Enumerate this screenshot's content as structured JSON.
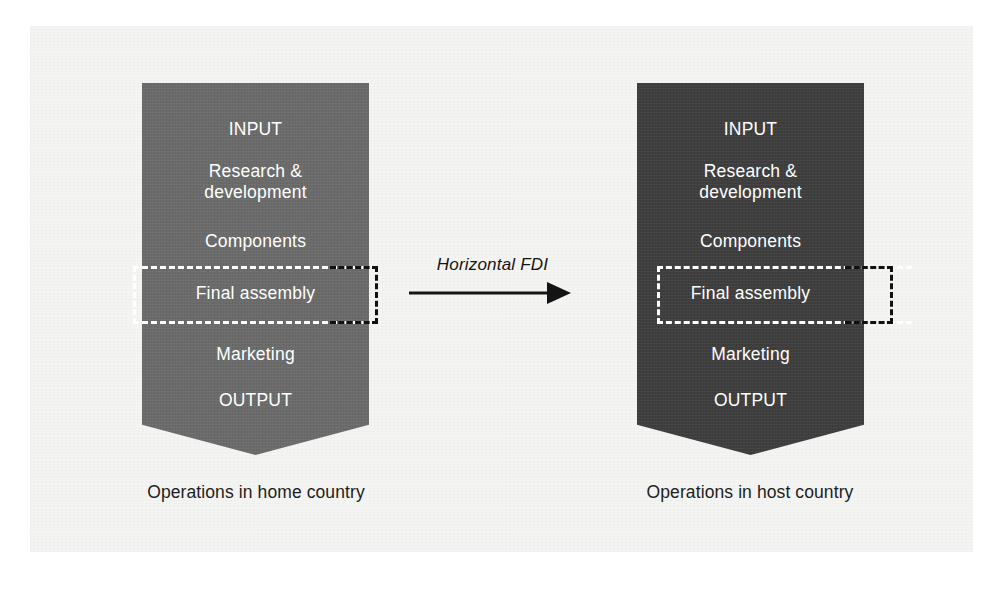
{
  "diagram": {
    "title_label": "Horizontal FDI",
    "arrow": {
      "name": "horizontal-fdi-arrow",
      "direction": "right"
    },
    "colors": {
      "page_background": "#ffffff",
      "plate_background": "#f4f4f2",
      "home_shape_fill": "#6b6b6b",
      "host_shape_fill": "#3e3e3e",
      "shape_text": "#ffffff",
      "caption_text": "#1d1d1d",
      "dash_inner": "#ffffff",
      "dash_outer": "#111111",
      "arrow_color": "#141414"
    },
    "home": {
      "caption": "Operations in home country",
      "rows": {
        "input": "INPUT",
        "rnd": "Research &\ndevelopment",
        "components": "Components",
        "final_assembly": "Final assembly",
        "marketing": "Marketing",
        "output": "OUTPUT"
      }
    },
    "host": {
      "caption": "Operations in host country",
      "rows": {
        "input": "INPUT",
        "rnd": "Research &\ndevelopment",
        "components": "Components",
        "final_assembly": "Final assembly",
        "marketing": "Marketing",
        "output": "OUTPUT"
      }
    }
  }
}
